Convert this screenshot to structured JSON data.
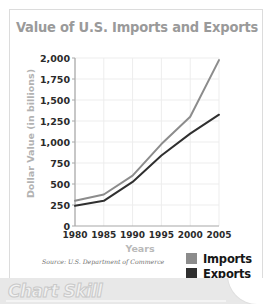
{
  "chart_data": {
    "type": "line",
    "title": "Value of U.S. Imports and Exports",
    "xlabel": "Years",
    "ylabel": "Dollar Value (in billions)",
    "x": [
      1980,
      1985,
      1990,
      1995,
      2000,
      2005
    ],
    "xticklabels": [
      "1980",
      "1985",
      "1990",
      "1995",
      "2000",
      "2005"
    ],
    "yticklabels": [
      "0",
      "250",
      "500",
      "750",
      "1,000",
      "1,250",
      "1,500",
      "1,750",
      "2,000"
    ],
    "ytickvalues": [
      0,
      250,
      500,
      750,
      1000,
      1250,
      1500,
      1750,
      2000
    ],
    "ylim": [
      0,
      2000
    ],
    "xlim": [
      1980,
      2005
    ],
    "grid": true,
    "legend_position": "bottom-right",
    "series": [
      {
        "name": "Imports",
        "color": "#8c8c8c",
        "values": [
          300,
          375,
          600,
          975,
          1300,
          1975
        ]
      },
      {
        "name": "Exports",
        "color": "#2f2f2f",
        "values": [
          240,
          300,
          525,
          840,
          1100,
          1325
        ]
      }
    ],
    "source": "Source: U.S. Department of Commerce"
  },
  "legend": {
    "items": [
      {
        "label": "Imports",
        "color": "#8c8c8c"
      },
      {
        "label": "Exports",
        "color": "#2f2f2f"
      }
    ]
  },
  "banner": {
    "label": "Chart Skill"
  },
  "colors": {
    "title": "#9a9a9a",
    "axis_label": "#b5b5b5",
    "tick": "#2b2b2b",
    "grid": "#ededed",
    "axis_line": "#a8a8a8",
    "frame": "#dcdcdc",
    "banner_bg": "#e8e8e8"
  }
}
